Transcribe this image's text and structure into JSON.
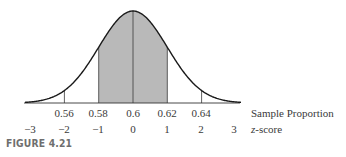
{
  "figure": {
    "caption": "FIGURE 4.21"
  },
  "colors": {
    "curve": "#1a1a1a",
    "shade": "#b9b9b9",
    "axis": "#333333",
    "text": "#3a3a3a"
  },
  "chart_data": {
    "type": "area",
    "title": "",
    "mean": 0.6,
    "std_error": 0.02,
    "shaded_range": [
      0.58,
      0.62
    ],
    "shaded_z_range": [
      -1,
      1
    ],
    "x_axis_primary": {
      "label": "Sample Proportion",
      "ticks": [
        0.56,
        0.58,
        0.6,
        0.62,
        0.64
      ],
      "tick_labels": [
        "0.56",
        "0.58",
        "0.6",
        "0.62",
        "0.64"
      ]
    },
    "x_axis_secondary": {
      "label": "z-score",
      "ticks": [
        -3,
        -2,
        -1,
        0,
        1,
        2,
        3
      ],
      "tick_labels": [
        "−3",
        "−2",
        "−1",
        "0",
        "1",
        "2",
        "3"
      ]
    },
    "vertical_lines_at": [
      0.56,
      0.58,
      0.6,
      0.62,
      0.64
    ],
    "xlim_z": [
      -3,
      3
    ],
    "grid": false,
    "legend": null
  },
  "labels": {
    "p056": "0.56",
    "p058": "0.58",
    "p060": "0.6",
    "p062": "0.62",
    "p064": "0.64",
    "sample_proportion": "Sample Proportion",
    "zm3": "−3",
    "zm2": "−2",
    "zm1": "−1",
    "z0": "0",
    "z1": "1",
    "z2": "2",
    "z3": "3",
    "zscore_z": "z",
    "zscore_rest": "-score"
  }
}
